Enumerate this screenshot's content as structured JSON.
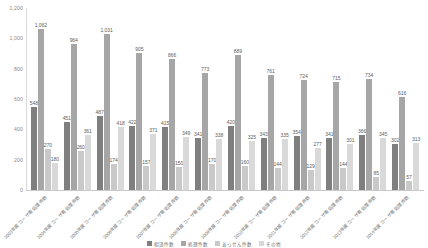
{
  "chart_data": {
    "type": "bar",
    "title": "",
    "xlabel": "",
    "ylabel": "",
    "ylim": [
      0,
      1200
    ],
    "grid": false,
    "legend_position": "bottom",
    "yticks": [
      "0",
      "200",
      "400",
      "600",
      "800",
      "1,000",
      "1,200"
    ],
    "ytick_values": [
      0,
      200,
      400,
      600,
      800,
      1000,
      1200
    ],
    "categories": [
      "2003年度コーザ等処理件数",
      "2004年度コーザ等処理件数",
      "2005年度コーザ等処理件数",
      "2006年度コーザ等処理件数",
      "2007年度コーザ等処理件数",
      "2008年度コーザ等処理件数",
      "2009年度コーザ等処理件数",
      "2010年度コーザ等処理件数",
      "2011年度コーザ等処理件数",
      "2012年度コーザ等処理件数",
      "2013年度コーザ等処理件数",
      "2014年度コーザ等処理件数"
    ],
    "series": [
      {
        "name": "相談件数",
        "color": "#7f7f7f",
        "values": [
          548,
          451,
          487,
          422,
          415,
          341,
          420,
          343,
          354,
          341,
          366,
          302
        ]
      },
      {
        "name": "処理件数",
        "color": "#a6a6a6",
        "values": [
          1062,
          964,
          1031,
          905,
          866,
          773,
          889,
          761,
          724,
          715,
          734,
          616
        ]
      },
      {
        "name": "あっせん件数",
        "color": "#c9c9c9",
        "values": [
          270,
          260,
          174,
          157,
          150,
          170,
          160,
          144,
          129,
          144,
          85,
          57
        ]
      },
      {
        "name": "その他",
        "color": "#d9d9d9",
        "values": [
          180,
          361,
          418,
          371,
          349,
          338,
          325,
          335,
          277,
          301,
          345,
          313
        ]
      }
    ]
  },
  "legend": {
    "items": [
      {
        "label": "相談件数",
        "color": "#7f7f7f"
      },
      {
        "label": "処理件数",
        "color": "#a6a6a6"
      },
      {
        "label": "あっせん件数",
        "color": "#c9c9c9"
      },
      {
        "label": "その他",
        "color": "#d9d9d9"
      }
    ]
  }
}
